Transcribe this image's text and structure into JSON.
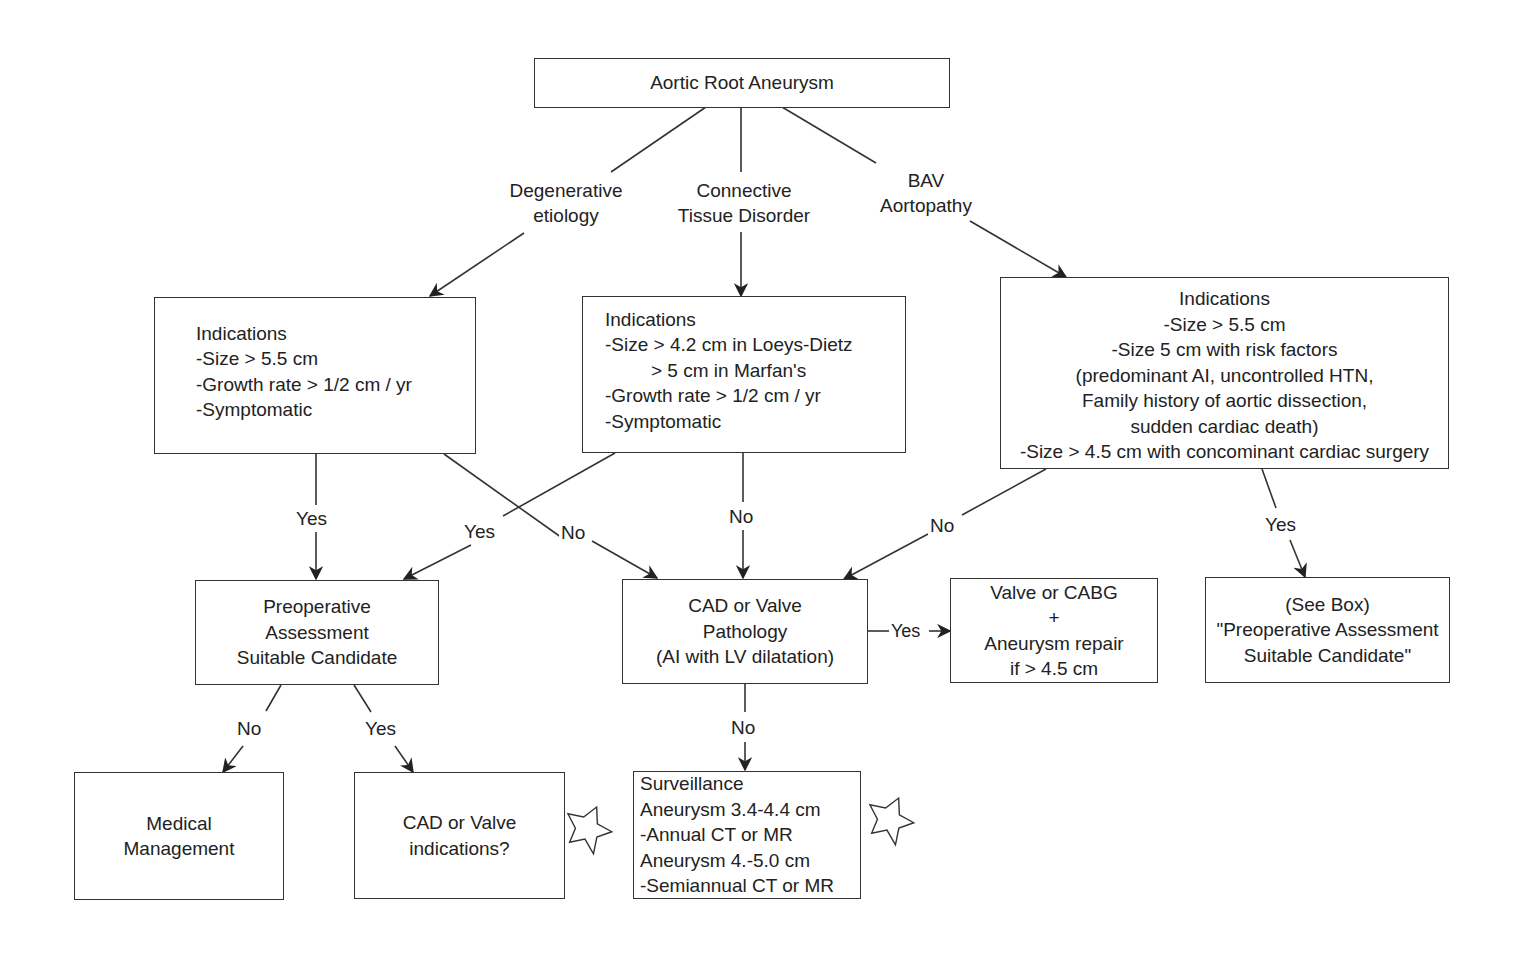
{
  "diagram": {
    "title_node": {
      "id": "root",
      "text": "Aortic Root Aneurysm"
    },
    "branches": [
      {
        "id": "degenerative",
        "lines": [
          "Degenerative",
          "etiology"
        ]
      },
      {
        "id": "connective",
        "lines": [
          "Connective",
          "Tissue Disorder"
        ]
      },
      {
        "id": "bav",
        "lines": [
          "BAV",
          "Aortopathy"
        ]
      }
    ],
    "nodes": {
      "ind_degenerative": {
        "lines": [
          "Indications",
          "-Size > 5.5 cm",
          "-Growth rate > 1/2 cm / yr",
          "-Symptomatic"
        ]
      },
      "ind_connective": {
        "lines": [
          "Indications",
          "-Size > 4.2 cm in Loeys-Dietz",
          "        > 5 cm in Marfan's",
          "-Growth rate > 1/2 cm / yr",
          "-Symptomatic"
        ]
      },
      "ind_bav": {
        "lines": [
          "Indications",
          "-Size > 5.5 cm",
          "-Size 5 cm with risk factors",
          "(predominant AI, uncontrolled HTN,",
          "Family history of aortic dissection,",
          "sudden cardiac death)",
          "-Size > 4.5 cm with concominant cardiac surgery"
        ]
      },
      "preop": {
        "lines": [
          "Preoperative",
          "Assessment",
          "Suitable Candidate"
        ]
      },
      "cad_valve": {
        "lines": [
          "CAD or Valve",
          "Pathology",
          "(AI with LV dilatation)"
        ]
      },
      "valve_cabg": {
        "lines": [
          "Valve or CABG",
          "+",
          "Aneurysm repair",
          "if > 4.5 cm"
        ]
      },
      "see_box": {
        "lines": [
          "(See Box)",
          "\"Preoperative Assessment",
          "Suitable Candidate\""
        ]
      },
      "medical": {
        "lines": [
          "Medical",
          "Management"
        ]
      },
      "cad_valve_ind": {
        "lines": [
          "CAD or Valve",
          "indications?"
        ]
      },
      "surveillance": {
        "lines": [
          "Surveillance",
          "Aneurysm 3.4-4.4 cm",
          "-Annual CT or MR",
          "Aneurysm 4.-5.0 cm",
          "-Semiannual CT or MR"
        ]
      }
    },
    "edge_labels": {
      "deg_yes": "Yes",
      "con_yes": "Yes",
      "deg_no": "No",
      "con_no": "No",
      "bav_no": "No",
      "bav_yes": "Yes",
      "cad_yes": "Yes",
      "cad_no": "No",
      "preop_no": "No",
      "preop_yes": "Yes"
    },
    "markers": [
      {
        "id": "star-1",
        "shape": "star-outline",
        "near": "cad_valve_ind"
      },
      {
        "id": "star-2",
        "shape": "star-outline",
        "near": "surveillance"
      }
    ],
    "colors": {
      "stroke": "#333333",
      "text": "#222222",
      "background": "#ffffff"
    }
  }
}
